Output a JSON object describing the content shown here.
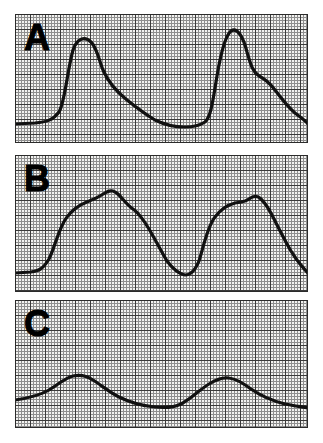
{
  "figure": {
    "background_color": "#ffffff",
    "paper_color": "#f2f2f0",
    "grid_minor_color": "#8e8e8e",
    "grid_major_color": "#3a3a3a",
    "trace_color": "#111111",
    "border_color": "#2b2b2b",
    "panel_count": 3
  },
  "panels": [
    {
      "label": "A",
      "name": "panel-a",
      "description": "Sharp high-amplitude pulse waveform, two cycles, steep upstroke with dicrotic shoulder on decay",
      "baseline_level": 0.1,
      "peak_level": 0.83,
      "cycles": 2
    },
    {
      "label": "B",
      "name": "panel-b",
      "description": "Rounded medium-amplitude waveform, two broad cycles with flattened plateau tops",
      "baseline_level": 0.08,
      "peak_level": 0.62,
      "cycles": 2
    },
    {
      "label": "C",
      "name": "panel-c",
      "description": "Low-amplitude smooth sinusoidal waveform, two shallow cycles",
      "baseline_level": 0.18,
      "peak_level": 0.36,
      "cycles": 2
    }
  ],
  "chart_data": [
    {
      "type": "line",
      "name": "panel-a-trace",
      "title": "A",
      "xlabel": "",
      "ylabel": "",
      "xlim": [
        0,
        293
      ],
      "ylim": [
        0,
        1
      ],
      "grid": true,
      "legend": "none",
      "minor_grid_px": 3,
      "major_grid_px": 15,
      "path": "M 0,110 L 20,109 C 32,108 38,106 44,98 C 50,88 52,58 58,36 C 62,24 70,22 76,28 C 82,34 84,46 88,56 C 94,70 102,78 112,86 C 122,94 130,100 140,106 C 150,111 160,113 170,113 C 178,113 184,112 190,108 C 196,103 198,86 202,62 C 206,38 210,22 216,17 C 222,13 228,22 232,38 C 236,52 238,58 244,62 C 250,65 254,68 260,76 C 266,84 272,92 280,99 C 288,105 292,108 293,110",
      "annotations": [
        "two pulse cycles",
        "steep systolic upstroke",
        "dicrotic shoulder"
      ]
    },
    {
      "type": "line",
      "name": "panel-b-trace",
      "title": "B",
      "xlabel": "",
      "ylabel": "",
      "xlim": [
        0,
        293
      ],
      "ylim": [
        0,
        1
      ],
      "grid": true,
      "legend": "none",
      "minor_grid_px": 3,
      "major_grid_px": 15,
      "path": "M 0,118 L 16,117 C 24,116 28,114 34,104 C 40,92 44,72 52,62 C 58,54 64,50 72,47 C 80,44 84,42 90,38 C 96,34 100,36 104,40 C 108,44 112,50 118,54 C 124,58 128,64 134,74 C 140,84 146,96 152,106 C 158,114 164,119 170,120 C 176,120 180,116 184,106 C 188,94 192,72 200,62 C 206,54 212,50 220,48 C 226,47 230,47 234,44 C 238,41 242,40 246,44 C 250,48 254,54 258,62 C 264,74 270,86 276,96 C 282,106 288,113 293,118",
      "annotations": [
        "two broad cycles",
        "plateau tops",
        "gradual decay"
      ]
    },
    {
      "type": "line",
      "name": "panel-c-trace",
      "title": "C",
      "xlabel": "",
      "ylabel": "",
      "xlim": [
        0,
        293
      ],
      "ylim": [
        0,
        1
      ],
      "grid": true,
      "legend": "none",
      "minor_grid_px": 3,
      "major_grid_px": 15,
      "path": "M 0,100 C 14,98 24,96 34,90 C 44,84 50,78 58,76 C 66,74 72,76 78,80 C 86,85 94,92 104,97 C 116,103 128,106 140,107 C 150,108 158,108 166,104 C 176,99 184,90 194,84 C 202,79 208,77 214,78 C 222,79 228,83 236,89 C 246,96 258,101 270,104 C 280,106 288,107 293,108",
      "annotations": [
        "two shallow cycles",
        "smooth damped waveform",
        "low amplitude"
      ]
    }
  ]
}
